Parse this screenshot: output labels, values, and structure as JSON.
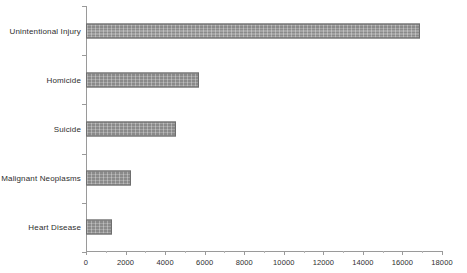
{
  "chart_data": {
    "type": "bar",
    "orientation": "horizontal",
    "title": "",
    "xlabel": "",
    "ylabel": "",
    "categories": [
      "Unintentional Injury",
      "Homicide",
      "Suicide",
      "Malignant Neoplasms",
      "Heart Disease"
    ],
    "values": [
      16900,
      5700,
      4550,
      2250,
      1300
    ],
    "xlim": [
      0,
      18000
    ],
    "xticks": [
      0,
      2000,
      4000,
      6000,
      8000,
      10000,
      12000,
      14000,
      16000,
      18000
    ],
    "xtick_labels": [
      "0",
      "2000",
      "4000",
      "6000",
      "8000",
      "10000",
      "12000",
      "14000",
      "16000",
      "18000"
    ],
    "grid": false,
    "legend": false,
    "bar_color": "#8a8a8a",
    "bar_edge_color": "#6e6e6e",
    "axis_color": "#9a9a9a",
    "text_color": "#2e2e2e",
    "background": "#ffffff"
  }
}
